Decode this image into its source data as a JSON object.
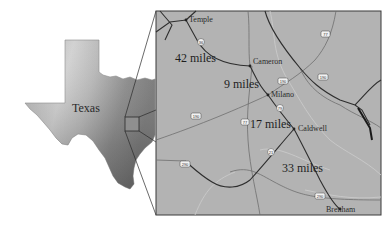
{
  "inset": {
    "state_label": "Texas"
  },
  "detail_map": {
    "cities": [
      {
        "name": "Temple",
        "x": 187,
        "y": 20
      },
      {
        "name": "Cameron",
        "x": 250,
        "y": 66
      },
      {
        "name": "Milano",
        "x": 267,
        "y": 94
      },
      {
        "name": "Caldwell",
        "x": 294,
        "y": 129
      },
      {
        "name": "Brenham",
        "x": 340,
        "y": 209
      }
    ],
    "distances": [
      {
        "label": "42 miles",
        "x": 175,
        "y": 62
      },
      {
        "label": "9 miles",
        "x": 224,
        "y": 88
      },
      {
        "label": "17 miles",
        "x": 250,
        "y": 128
      },
      {
        "label": "33 miles",
        "x": 282,
        "y": 172
      }
    ],
    "highway_shields": [
      {
        "number": "36",
        "x": 201,
        "y": 42,
        "shape": "circle"
      },
      {
        "number": "77",
        "x": 325,
        "y": 34,
        "shape": "box"
      },
      {
        "number": "190",
        "x": 283,
        "y": 81,
        "shape": "box"
      },
      {
        "number": "190",
        "x": 323,
        "y": 77,
        "shape": "box"
      },
      {
        "number": "79",
        "x": 280,
        "y": 108,
        "shape": "circle"
      },
      {
        "number": "190",
        "x": 196,
        "y": 116,
        "shape": "box"
      },
      {
        "number": "77",
        "x": 245,
        "y": 122,
        "shape": "box"
      },
      {
        "number": "21",
        "x": 271,
        "y": 152,
        "shape": "circle"
      },
      {
        "number": "290",
        "x": 185,
        "y": 164,
        "shape": "box"
      },
      {
        "number": "290",
        "x": 320,
        "y": 196,
        "shape": "box"
      }
    ]
  },
  "colors": {
    "map_fill": "#b3b3b3",
    "map_border": "#3a3a3a",
    "road_major": "#2e2e2e",
    "road_minor": "#8a8a8a",
    "river": "#9e9e9e"
  }
}
